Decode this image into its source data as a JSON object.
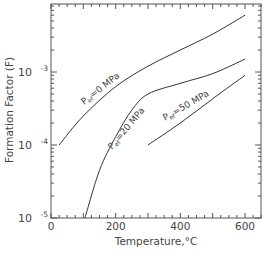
{
  "chart_data": {
    "type": "line",
    "title": "",
    "xlabel": "Temperature,°C",
    "ylabel": "Formation Factor (F)",
    "xlim": [
      0,
      650
    ],
    "ylim": [
      1e-05,
      0.008
    ],
    "yscale": "log",
    "x_ticks": [
      0,
      200,
      400,
      600
    ],
    "x_tick_labels": [
      "0",
      "200",
      "400",
      "600"
    ],
    "y_ticks": [
      1e-05,
      0.0001,
      0.001
    ],
    "y_tick_labels": [
      {
        "base": "10",
        "exp": "-5"
      },
      {
        "base": "10",
        "exp": "-4"
      },
      {
        "base": "10",
        "exp": "-3"
      }
    ],
    "grid": false,
    "legend": "inline labels",
    "series": [
      {
        "name": "Pef=0 MPa",
        "label_main": "P",
        "label_sub": "ef",
        "label_rest": "=0 MPa",
        "x": [
          25,
          100,
          200,
          300,
          400,
          500,
          600
        ],
        "y": [
          0.0001,
          0.00025,
          0.00063,
          0.0012,
          0.002,
          0.0033,
          0.006
        ]
      },
      {
        "name": "Pef=20 MPa",
        "label_main": "P",
        "label_sub": "ef",
        "label_rest": "=20 MPa",
        "x": [
          105,
          150,
          200,
          250,
          300,
          400,
          500,
          600
        ],
        "y": [
          1e-05,
          4.5e-05,
          0.00013,
          0.0003,
          0.0005,
          0.0007,
          0.00095,
          0.0015
        ]
      },
      {
        "name": "Pef=50 MPa",
        "label_main": "P",
        "label_sub": "ef",
        "label_rest": "=50 MPa",
        "x": [
          300,
          400,
          500,
          600
        ],
        "y": [
          0.0001,
          0.0002,
          0.00043,
          0.0009
        ]
      }
    ]
  },
  "colors": {
    "axis": "#555555",
    "line": "#333333",
    "text": "#444444"
  }
}
